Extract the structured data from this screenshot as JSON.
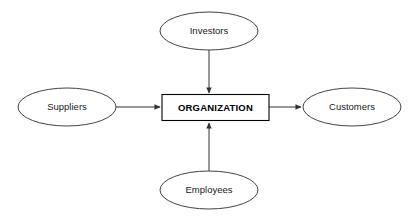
{
  "diagram": {
    "background_color": "#ffffff",
    "stroke_color": "#434343",
    "center": {
      "label": "ORGANIZATION",
      "shape": "rectangle",
      "x": 162,
      "y": 95,
      "width": 107,
      "height": 26
    },
    "nodes": [
      {
        "id": "investors",
        "label": "Investors",
        "shape": "ellipse",
        "position": "top",
        "cx": 209,
        "cy": 31,
        "rx": 49,
        "ry": 19
      },
      {
        "id": "suppliers",
        "label": "Suppliers",
        "shape": "ellipse",
        "position": "left",
        "cx": 67,
        "cy": 107,
        "rx": 49,
        "ry": 19
      },
      {
        "id": "customers",
        "label": "Customers",
        "shape": "ellipse",
        "position": "right",
        "cx": 352,
        "cy": 107,
        "rx": 49,
        "ry": 19
      },
      {
        "id": "employees",
        "label": "Employees",
        "shape": "ellipse",
        "position": "bottom",
        "cx": 209,
        "cy": 190,
        "rx": 49,
        "ry": 19
      }
    ],
    "connectors": [
      {
        "id": "investors-to-organization",
        "from": "investors",
        "to": "center",
        "direction": "down",
        "arrowhead": "filled-triangle"
      },
      {
        "id": "suppliers-to-organization",
        "from": "suppliers",
        "to": "center",
        "direction": "right",
        "arrowhead": "filled-triangle"
      },
      {
        "id": "organization-to-customers",
        "from": "center",
        "to": "customers",
        "direction": "right",
        "arrowhead": "filled-triangle"
      },
      {
        "id": "employees-to-organization",
        "from": "employees",
        "to": "center",
        "direction": "up",
        "arrowhead": "filled-triangle"
      }
    ]
  }
}
